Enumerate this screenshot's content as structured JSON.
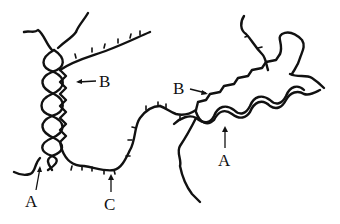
{
  "diagram": {
    "type": "molecular-structure-illustration",
    "labels": [
      {
        "id": "A-left",
        "text": "A",
        "points_to": "twisted double helix (left)"
      },
      {
        "id": "B-left",
        "text": "B",
        "points_to": "zig-zag strand (left)"
      },
      {
        "id": "C",
        "text": "C",
        "points_to": "random-coil chain with side groups"
      },
      {
        "id": "B-right",
        "text": "B",
        "points_to": "zig-zag strand (right)"
      },
      {
        "id": "A-right",
        "text": "A",
        "points_to": "twisted double helix (right)"
      }
    ],
    "colors": {
      "stroke": "#111111",
      "background": "#ffffff"
    }
  }
}
